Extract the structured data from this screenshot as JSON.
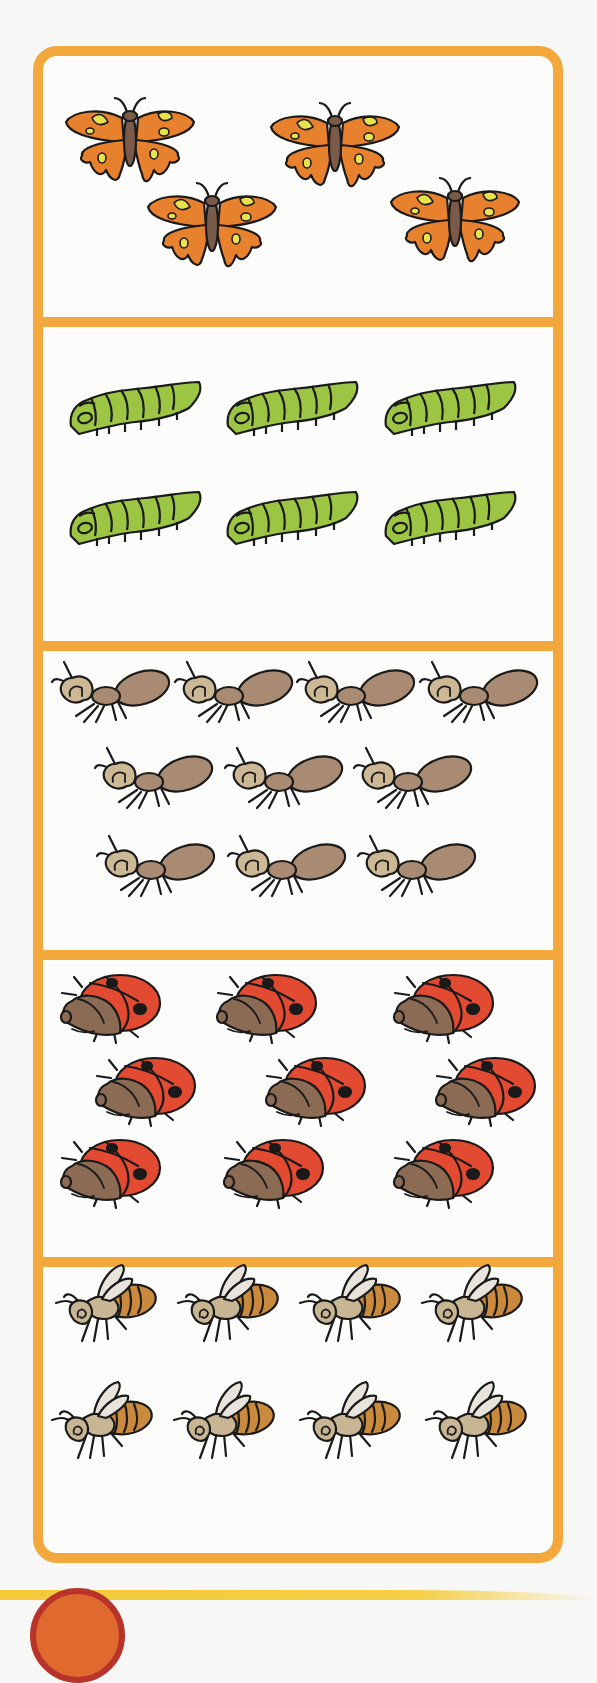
{
  "page": {
    "colors": {
      "border": "#f2a83c",
      "background": "#fcfcfb",
      "butterfly_wing": "#e8812e",
      "butterfly_spot": "#e9e24a",
      "butterfly_body": "#7a5a48",
      "caterpillar": "#9cc544",
      "ant_body": "#a88b72",
      "ant_head": "#cdb895",
      "ladybug_shell": "#e24b32",
      "ladybug_head": "#8c6b55",
      "bee_stripes": "#c98a3e",
      "bee_body": "#c7b594",
      "bee_wing": "#e8e4dc",
      "outline": "#1a1a1a",
      "bottom_band": "#f4c93a",
      "bottom_circle": "#b8332a"
    }
  },
  "sections": [
    {
      "name": "butterflies",
      "count": 4,
      "items": [
        {
          "x": 130,
          "y": 140
        },
        {
          "x": 335,
          "y": 145
        },
        {
          "x": 212,
          "y": 225
        },
        {
          "x": 455,
          "y": 220
        }
      ]
    },
    {
      "name": "caterpillars",
      "count": 6,
      "items": [
        {
          "x": 135,
          "y": 410
        },
        {
          "x": 292,
          "y": 410
        },
        {
          "x": 450,
          "y": 410
        },
        {
          "x": 135,
          "y": 520
        },
        {
          "x": 292,
          "y": 520
        },
        {
          "x": 450,
          "y": 520
        }
      ]
    },
    {
      "name": "ants",
      "count": 10,
      "items": [
        {
          "x": 112,
          "y": 692
        },
        {
          "x": 235,
          "y": 692
        },
        {
          "x": 357,
          "y": 692
        },
        {
          "x": 480,
          "y": 692
        },
        {
          "x": 155,
          "y": 778
        },
        {
          "x": 285,
          "y": 778
        },
        {
          "x": 414,
          "y": 778
        },
        {
          "x": 157,
          "y": 866
        },
        {
          "x": 288,
          "y": 866
        },
        {
          "x": 418,
          "y": 866
        }
      ]
    },
    {
      "name": "ladybugs",
      "count": 9,
      "items": [
        {
          "x": 112,
          "y": 1005
        },
        {
          "x": 268,
          "y": 1005
        },
        {
          "x": 445,
          "y": 1005
        },
        {
          "x": 147,
          "y": 1088
        },
        {
          "x": 317,
          "y": 1088
        },
        {
          "x": 487,
          "y": 1088
        },
        {
          "x": 112,
          "y": 1170
        },
        {
          "x": 275,
          "y": 1170
        },
        {
          "x": 445,
          "y": 1170
        }
      ]
    },
    {
      "name": "bees",
      "count": 8,
      "items": [
        {
          "x": 108,
          "y": 1305
        },
        {
          "x": 230,
          "y": 1305
        },
        {
          "x": 352,
          "y": 1305
        },
        {
          "x": 474,
          "y": 1305
        },
        {
          "x": 104,
          "y": 1422
        },
        {
          "x": 226,
          "y": 1422
        },
        {
          "x": 352,
          "y": 1422
        },
        {
          "x": 478,
          "y": 1422
        }
      ]
    }
  ]
}
